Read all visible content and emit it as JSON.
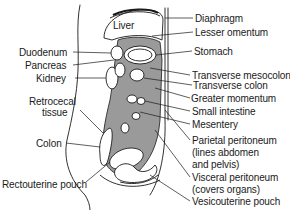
{
  "figure": {
    "type": "anatomical-diagram",
    "colors": {
      "line": "#1a1a1a",
      "shade": "#9a9a9a",
      "background": "#ffffff"
    }
  },
  "labels": {
    "inner": {
      "liver": "Liver"
    },
    "left": {
      "duodenum": "Duodenum",
      "pancreas": "Pancreas",
      "kidney": "Kidney",
      "retrocecal_1": "Retrocecal",
      "retrocecal_2": "tissue",
      "colon": "Colon",
      "rectouterine": "Rectouterine pouch"
    },
    "right": {
      "diaphragm": "Diaphragm",
      "lesser_omentum": "Lesser omentum",
      "stomach": "Stomach",
      "transverse_mesocolon": "Transverse mesocolon",
      "transverse_colon": "Transverse colon",
      "greater_omentum": "Greater momentum",
      "small_intestine": "Small intestine",
      "mesentery": "Mesentery",
      "parietal_1": "Parietal peritoneum",
      "parietal_2": "(lines abdomen",
      "parietal_3": "and pelvis)",
      "visceral_1": "Visceral peritoneum",
      "visceral_2": "(covers organs)",
      "vesicouterine": "Vesicouterine pouch"
    }
  }
}
